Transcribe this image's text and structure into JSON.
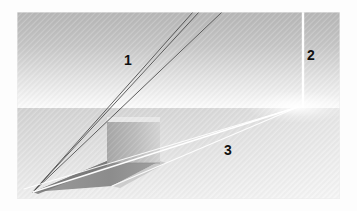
{
  "figure": {
    "frame": {
      "x": 17,
      "y": 12,
      "width": 323,
      "height": 187
    },
    "background_color": "#fdfdfd",
    "colors": {
      "sky_top": "#b9b9b9",
      "sky_bottom": "#fbfbfb",
      "ground_top": "#d6d6d6",
      "ground_bottom": "#efefef",
      "cube_face": "#b2b2b2",
      "cube_face_light": "#cfcfcf",
      "cube_top": "#e9e9e9",
      "shadow_dark": "#8e8e8e",
      "shadow_mid": "#a5a5a5",
      "ray_dark": "#4a4a4a",
      "ray_light": "#ffffff",
      "divider": "#ffffff",
      "label_text": "#111111"
    },
    "horizon_y": 108,
    "texture": "diagonal-hatch",
    "labels": [
      {
        "id": "label-1",
        "text": "1",
        "x": 128,
        "y": 60,
        "region": "sky-left"
      },
      {
        "id": "label-2",
        "text": "2",
        "x": 310,
        "y": 55,
        "region": "sky-right-panel"
      },
      {
        "id": "label-3",
        "text": "3",
        "x": 228,
        "y": 150,
        "region": "ground-right"
      }
    ],
    "regions": {
      "sky": {
        "name": "upper-band",
        "y_top": 12,
        "y_bottom": 108
      },
      "ground": {
        "name": "lower-band",
        "y_top": 108,
        "y_bottom": 199
      }
    },
    "divider": {
      "x": 303,
      "y_top": 12,
      "y_bottom": 108
    },
    "vanishing_points": {
      "light_source_left": {
        "x": 33,
        "y": 192
      },
      "horizon_right": {
        "x": 298,
        "y": 107
      }
    },
    "cube": {
      "left": 107,
      "right": 160,
      "top": 117,
      "bottom": 163,
      "top_face_points": "107,117 160,117 160,122 107,122"
    },
    "dark_rays": [
      {
        "id": "ray-a",
        "from_x": 193,
        "from_y": 12,
        "to_x": 33,
        "to_y": 192
      },
      {
        "id": "ray-b",
        "from_x": 199,
        "from_y": 12,
        "to_x": 33,
        "to_y": 192
      },
      {
        "id": "ray-c",
        "from_x": 222,
        "from_y": 12,
        "to_x": 33,
        "to_y": 192
      }
    ],
    "light_rays": [
      {
        "id": "light-a",
        "from_x": 33,
        "from_y": 192,
        "to_x": 298,
        "to_y": 107
      },
      {
        "id": "light-b",
        "from_x": 33,
        "from_y": 192,
        "to_x": 298,
        "to_y": 107
      },
      {
        "id": "light-c",
        "from_x": 33,
        "from_y": 192,
        "to_x": 298,
        "to_y": 107
      }
    ],
    "shadow_polygon": "33,192 107,163 160,163 110,185"
  }
}
